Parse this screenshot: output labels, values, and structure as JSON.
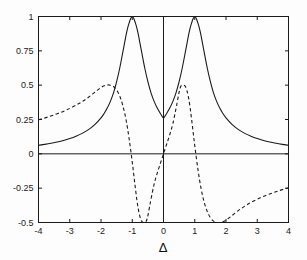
{
  "chart_data": {
    "type": "line",
    "title": "",
    "subtitle": "",
    "xlabel": "Δ",
    "ylabel": "",
    "xlim": [
      -4,
      4
    ],
    "ylim": [
      -0.5,
      1
    ],
    "grid": false,
    "legend": "none",
    "box": true,
    "x_ticks": [
      -4,
      -3,
      -2,
      -1,
      0,
      1,
      2,
      3,
      4
    ],
    "x_tick_labels": [
      "-4",
      "-3",
      "-2",
      "-1",
      "0",
      "1",
      "2",
      "3",
      "4"
    ],
    "y_ticks": [
      -0.5,
      -0.25,
      0,
      0.25,
      0.5,
      0.75,
      1
    ],
    "y_tick_labels": [
      "-0.5",
      "-0.25",
      "0",
      "0.25",
      "0.5",
      "0.75",
      "1"
    ],
    "zero_lines": {
      "horizontal_y": 0,
      "vertical_x": 0
    },
    "series": [
      {
        "name": "solid-curve",
        "style": "solid",
        "color": "#1a1a1a",
        "width": 1.1,
        "x": [
          -4,
          -3.8,
          -3.6,
          -3.4,
          -3.2,
          -3,
          -2.8,
          -2.6,
          -2.4,
          -2.2,
          -2,
          -1.9,
          -1.8,
          -1.7,
          -1.6,
          -1.5,
          -1.4,
          -1.3,
          -1.2,
          -1.15,
          -1.1,
          -1.05,
          -1,
          -0.95,
          -0.9,
          -0.85,
          -0.8,
          -0.7,
          -0.6,
          -0.5,
          -0.4,
          -0.3,
          -0.2,
          -0.1,
          0,
          0.1,
          0.2,
          0.3,
          0.4,
          0.5,
          0.6,
          0.7,
          0.8,
          0.85,
          0.9,
          0.95,
          1,
          1.05,
          1.1,
          1.15,
          1.2,
          1.3,
          1.4,
          1.5,
          1.6,
          1.7,
          1.8,
          1.9,
          2,
          2.2,
          2.4,
          2.6,
          2.8,
          3,
          3.2,
          3.4,
          3.6,
          3.8,
          4
        ],
        "y": [
          0.062,
          0.069,
          0.077,
          0.086,
          0.097,
          0.111,
          0.128,
          0.149,
          0.176,
          0.212,
          0.262,
          0.294,
          0.333,
          0.382,
          0.444,
          0.525,
          0.625,
          0.742,
          0.862,
          0.913,
          0.953,
          0.985,
          1.0,
          0.985,
          0.953,
          0.913,
          0.862,
          0.742,
          0.625,
          0.525,
          0.444,
          0.382,
          0.333,
          0.294,
          0.262,
          0.294,
          0.333,
          0.382,
          0.444,
          0.525,
          0.625,
          0.742,
          0.862,
          0.913,
          0.953,
          0.985,
          1.0,
          0.985,
          0.953,
          0.913,
          0.862,
          0.742,
          0.625,
          0.525,
          0.444,
          0.382,
          0.333,
          0.294,
          0.262,
          0.212,
          0.176,
          0.149,
          0.128,
          0.111,
          0.097,
          0.086,
          0.077,
          0.069,
          0.062
        ]
      },
      {
        "name": "dashed-curve",
        "style": "dashed",
        "color": "#1a1a1a",
        "width": 1.1,
        "x": [
          -4,
          -3.7,
          -3.4,
          -3.1,
          -2.8,
          -2.6,
          -2.4,
          -2.2,
          -2.1,
          -2,
          -1.9,
          -1.8,
          -1.7,
          -1.6,
          -1.5,
          -1.4,
          -1.3,
          -1.2,
          -1.1,
          -1,
          -0.95,
          -0.9,
          -0.85,
          -0.8,
          -0.75,
          -0.7,
          -0.65,
          -0.6,
          -0.55,
          -0.5,
          -0.45,
          -0.4,
          -0.3,
          -0.2,
          -0.1,
          0,
          0.1,
          0.2,
          0.3,
          0.4,
          0.45,
          0.5,
          0.55,
          0.6,
          0.65,
          0.7,
          0.75,
          0.8,
          0.85,
          0.9,
          0.95,
          1,
          1.1,
          1.2,
          1.3,
          1.4,
          1.5,
          1.6,
          1.7,
          1.8,
          1.9,
          2,
          2.1,
          2.2,
          2.4,
          2.6,
          2.8,
          3.1,
          3.4,
          3.7,
          4
        ],
        "y": [
          0.248,
          0.268,
          0.292,
          0.32,
          0.354,
          0.381,
          0.412,
          0.448,
          0.466,
          0.483,
          0.495,
          0.502,
          0.5,
          0.49,
          0.465,
          0.42,
          0.35,
          0.25,
          0.11,
          -0.06,
          -0.155,
          -0.25,
          -0.34,
          -0.41,
          -0.46,
          -0.49,
          -0.5,
          -0.5,
          -0.49,
          -0.45,
          -0.39,
          -0.33,
          -0.22,
          -0.14,
          -0.07,
          0,
          0.07,
          0.14,
          0.22,
          0.33,
          0.39,
          0.45,
          0.49,
          0.5,
          0.5,
          0.49,
          0.46,
          0.41,
          0.34,
          0.25,
          0.155,
          0.06,
          -0.11,
          -0.25,
          -0.35,
          -0.42,
          -0.465,
          -0.49,
          -0.5,
          -0.502,
          -0.495,
          -0.483,
          -0.466,
          -0.448,
          -0.412,
          -0.381,
          -0.354,
          -0.32,
          -0.292,
          -0.268,
          -0.248
        ]
      }
    ]
  }
}
